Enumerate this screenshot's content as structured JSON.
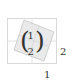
{
  "diagram": {
    "vector": {
      "top": "1",
      "bottom": "2",
      "open_paren": "(",
      "close_paren": ")"
    },
    "axis_labels": {
      "right": "2",
      "bottom": "1"
    },
    "colors": {
      "grid": "#d9d9d9",
      "shade": "#e4e4e4",
      "shade_stroke": "#c8c8c8",
      "text": "#333333"
    }
  }
}
